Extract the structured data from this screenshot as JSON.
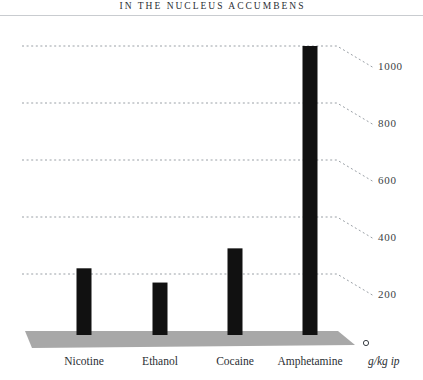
{
  "header": {
    "title": "IN THE NUCLEUS ACCUMBENS"
  },
  "axis": {
    "unit_caption": "g/kg ip"
  },
  "colors": {
    "bar": "#111111",
    "platform": "#a8a8a8",
    "gridline": "#9aa0a6",
    "title_text": "#2a2e33",
    "rule": "#c9ccd0",
    "background": "#ffffff"
  },
  "chart_data": {
    "type": "bar",
    "title": "IN THE NUCLEUS ACCUMBENS",
    "xlabel": "",
    "ylabel": "g/kg ip",
    "categories": [
      "Nicotine",
      "Ethanol",
      "Cocaine",
      "Amphetamine"
    ],
    "values": [
      220,
      170,
      290,
      1000
    ],
    "ylim": [
      0,
      1000
    ],
    "yticks": [
      0,
      200,
      400,
      600,
      800,
      1000
    ],
    "ytick_labels": [
      "0",
      "200",
      "400",
      "600",
      "800",
      "1000"
    ],
    "grid": true,
    "grid_style": "dotted",
    "legend": "none",
    "series": [
      {
        "name": "Dopamine increase",
        "values": [
          220,
          170,
          290,
          1000
        ]
      }
    ]
  }
}
